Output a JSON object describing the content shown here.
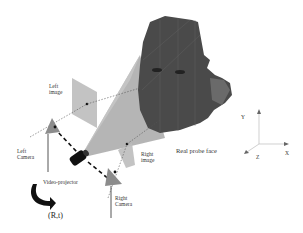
{
  "diagram": {
    "labels": {
      "left_image": [
        "Left",
        "image"
      ],
      "left_camera": [
        "Left",
        "Camera"
      ],
      "right_image": [
        "Right",
        "image"
      ],
      "right_camera": [
        "Right",
        "Camera"
      ],
      "video_projector": "Video-projector",
      "real_probe_face": "Real probe face",
      "transform": "(R,t)"
    },
    "axes": {
      "x": "X",
      "y": "Y",
      "z": "Z"
    },
    "colors": {
      "face": "#4a4a4a",
      "projection_cone": "#9a9a9a",
      "image_plane": "#bdbdbd",
      "camera": "#8c8c8c",
      "projector": "#111111",
      "axis": "#bbbbbb"
    }
  }
}
